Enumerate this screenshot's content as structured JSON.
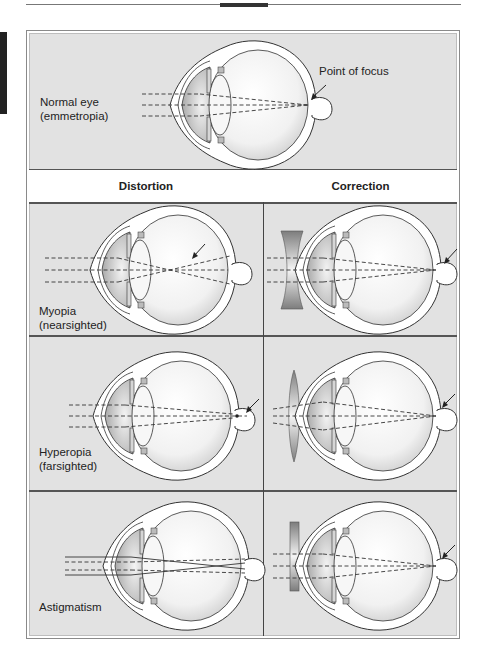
{
  "header": {
    "columns": [
      "Distortion",
      "Correction"
    ]
  },
  "normal": {
    "label_line1": "Normal eye",
    "label_line2": "(emmetropia)",
    "focus_label": "Point of focus"
  },
  "rows": [
    {
      "label_line1": "Myopia",
      "label_line2": "(nearsighted)",
      "correction_lens": "concave"
    },
    {
      "label_line1": "Hyperopia",
      "label_line2": "(farsighted)",
      "correction_lens": "convex"
    },
    {
      "label_line1": "Astigmatism",
      "label_line2": "",
      "correction_lens": "cylindrical"
    }
  ],
  "colors": {
    "panel_bg": "#e0e0e0",
    "header_bg": "#ffffff",
    "outline": "#333333",
    "lens_gray": "#8c8c8c"
  }
}
